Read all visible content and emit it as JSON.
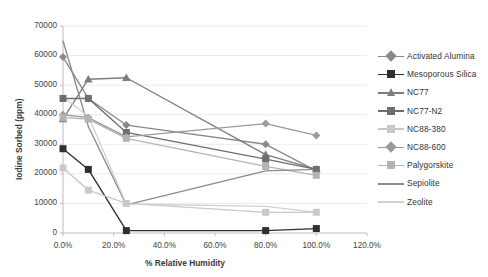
{
  "chart_data": {
    "type": "line",
    "title": "",
    "xlabel": "% Relative Humidity",
    "ylabel": "Iodine Sorbed (ppm)",
    "xlim": [
      0,
      120
    ],
    "ylim": [
      0,
      70000
    ],
    "xticks": [
      "0.0%",
      "20.0%",
      "40.0%",
      "60.0%",
      "80.0%",
      "100.0%",
      "120.0%"
    ],
    "xtick_values": [
      0,
      20,
      40,
      60,
      80,
      100,
      120
    ],
    "yticks": [
      "0",
      "10000",
      "20000",
      "30000",
      "40000",
      "50000",
      "60000",
      "70000"
    ],
    "ytick_values": [
      0,
      10000,
      20000,
      30000,
      40000,
      50000,
      60000,
      70000
    ],
    "grid": true,
    "legend_position": "right",
    "x": [
      0,
      10,
      25,
      80,
      100
    ],
    "series": [
      {
        "name": "Activated Alumina",
        "marker": "diamond",
        "color": "#8a8a8a",
        "values": [
          59500,
          45500,
          36500,
          30000,
          21000
        ]
      },
      {
        "name": "Mesoporous Silica",
        "marker": "square",
        "color": "#2f2f2f",
        "values": [
          28500,
          21500,
          800,
          800,
          1500
        ]
      },
      {
        "name": "NC77",
        "marker": "triangle",
        "color": "#7d7d7d",
        "values": [
          38500,
          52000,
          52500,
          26500,
          21500
        ]
      },
      {
        "name": "NC77-N2",
        "marker": "square",
        "color": "#6e6e6e",
        "values": [
          45500,
          45500,
          34000,
          25000,
          21500
        ]
      },
      {
        "name": "NC88-380",
        "marker": "square",
        "color": "#c9c9c9",
        "values": [
          22000,
          14500,
          10000,
          7000,
          7000
        ]
      },
      {
        "name": "NC88-600",
        "marker": "diamond",
        "color": "#9a9a9a",
        "values": [
          40000,
          39000,
          32500,
          37000,
          33000
        ]
      },
      {
        "name": "Palygorskite",
        "marker": "square",
        "color": "#b4b4b4",
        "values": [
          39000,
          38500,
          32000,
          22500,
          19500
        ]
      },
      {
        "name": "Sepiolite",
        "marker": "none",
        "color": "#8c8c8c",
        "values": [
          65000,
          36000,
          9500,
          21000,
          21500
        ]
      },
      {
        "name": "Zeolite",
        "marker": "none",
        "color": "#d2d2d2",
        "values": [
          46000,
          39500,
          9800,
          9000,
          7000
        ]
      }
    ]
  },
  "legend": {
    "items": [
      {
        "label": "Activated Alumina"
      },
      {
        "label": "Mesoporous Silica"
      },
      {
        "label": "NC77"
      },
      {
        "label": "NC77-N2"
      },
      {
        "label": "NC88-380"
      },
      {
        "label": "NC88-600"
      },
      {
        "label": "Palygorskite"
      },
      {
        "label": "Sepiolite"
      },
      {
        "label": "Zeolite"
      }
    ]
  }
}
